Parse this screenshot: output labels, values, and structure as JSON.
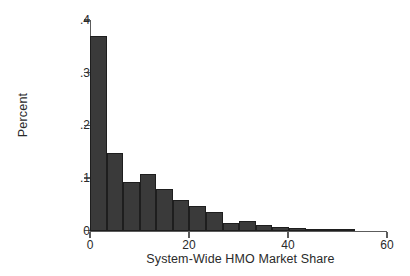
{
  "chart_data": {
    "type": "bar",
    "title": "",
    "subtitle": "",
    "xlabel": "System-Wide HMO Market Share",
    "ylabel": "Percent",
    "xlim": [
      0,
      60
    ],
    "ylim": [
      0,
      0.4
    ],
    "xticks": [
      0,
      20,
      40,
      60
    ],
    "xtick_labels": [
      "0",
      "20",
      "40",
      "60"
    ],
    "yticks": [
      0,
      0.1,
      0.2,
      0.3,
      0.4
    ],
    "ytick_labels": [
      "0",
      ".1",
      ".2",
      ".3",
      ".4"
    ],
    "grid": false,
    "legend": null,
    "legend_position": "none",
    "bin_width": 3.35,
    "bin_starts": [
      0,
      3.35,
      6.7,
      10.05,
      13.4,
      16.75,
      20.1,
      23.45,
      26.8,
      30.15,
      33.5,
      36.85,
      40.2,
      43.55,
      46.9,
      50.25
    ],
    "categories": [
      "0-3.4",
      "3.4-6.7",
      "6.7-10.1",
      "10.1-13.4",
      "13.4-16.8",
      "16.8-20.1",
      "20.1-23.5",
      "23.5-26.8",
      "26.8-30.2",
      "30.2-33.5",
      "33.5-36.9",
      "36.9-40.2",
      "40.2-43.6",
      "43.6-46.9",
      "46.9-50.3",
      "50.3-53.6"
    ],
    "values": [
      0.37,
      0.148,
      0.092,
      0.107,
      0.079,
      0.058,
      0.047,
      0.036,
      0.015,
      0.018,
      0.011,
      0.006,
      0.005,
      0.004,
      0.004,
      0.003
    ],
    "bar_color": "#3a3a3a",
    "bar_edge_color": "#1e1e1e",
    "axis_color": "#5c5c5c",
    "text_color": "#2a2a2a"
  }
}
